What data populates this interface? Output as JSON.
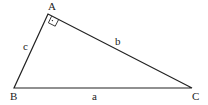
{
  "diagram": {
    "vertices": [
      {
        "label": "A",
        "x": 48,
        "y": 14
      },
      {
        "label": "B",
        "x": 14,
        "y": 88
      },
      {
        "label": "C",
        "x": 192,
        "y": 88
      }
    ],
    "sides": [
      {
        "label": "c",
        "from": "A",
        "to": "B"
      },
      {
        "label": "b",
        "from": "A",
        "to": "C"
      },
      {
        "label": "a",
        "from": "B",
        "to": "C"
      }
    ],
    "right_angle_at": "A",
    "line_color": "#222222"
  }
}
